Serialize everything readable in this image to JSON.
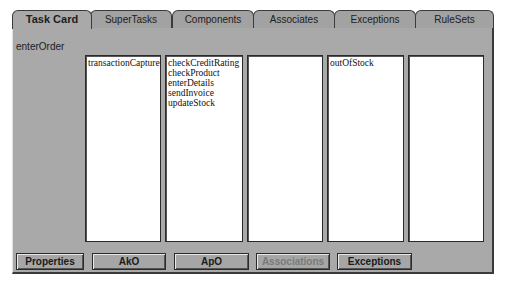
{
  "tabs": [
    {
      "label": "Task Card",
      "active": true
    },
    {
      "label": "SuperTasks",
      "active": false
    },
    {
      "label": "Components",
      "active": false
    },
    {
      "label": "Associates",
      "active": false
    },
    {
      "label": "Exceptions",
      "active": false
    },
    {
      "label": "RuleSets",
      "active": false
    }
  ],
  "task_name": "enterOrder",
  "lists": [
    {
      "items": [
        "transactionCapture"
      ]
    },
    {
      "items": [
        "checkCreditRating",
        "checkProduct",
        "enterDetails",
        "sendInvoice",
        "updateStock"
      ]
    },
    {
      "items": []
    },
    {
      "items": [
        "outOfStock"
      ]
    },
    {
      "items": []
    }
  ],
  "buttons": [
    {
      "label": "Properties",
      "enabled": true
    },
    {
      "label": "AkO",
      "enabled": true
    },
    {
      "label": "ApO",
      "enabled": true
    },
    {
      "label": "Associations",
      "enabled": false
    },
    {
      "label": "Exceptions",
      "enabled": true
    }
  ]
}
